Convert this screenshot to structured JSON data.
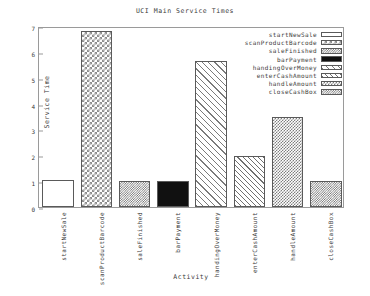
{
  "chart_data": {
    "type": "bar",
    "title": "UCI Main Service Times",
    "xlabel": "Activity",
    "ylabel": "Service Time",
    "ylim": [
      0,
      7
    ],
    "yticks": [
      "0",
      "1",
      "2",
      "3",
      "4",
      "5",
      "6",
      "7"
    ],
    "grid": false,
    "legend_position": "top-right",
    "categories": [
      "startNewSale",
      "scanProductBarcode",
      "saleFinished",
      "barPayment",
      "handingOverMoney",
      "enterCashAmount",
      "handleAmount",
      "closeCashBox"
    ],
    "values": [
      1.03,
      6.8,
      1.02,
      1.02,
      5.65,
      1.99,
      3.47,
      0.99
    ],
    "series": [
      {
        "name": "Service Time",
        "values": [
          1.03,
          6.8,
          1.02,
          1.02,
          5.65,
          1.99,
          3.47,
          0.99
        ]
      }
    ],
    "legend": [
      {
        "label": "startNewSale",
        "pattern": "empty"
      },
      {
        "label": "scanProductBarcode",
        "pattern": "check-coarse"
      },
      {
        "label": "saleFinished",
        "pattern": "check-dense"
      },
      {
        "label": "barPayment",
        "pattern": "solid"
      },
      {
        "label": "handingOverMoney",
        "pattern": "hatch-diag-wide"
      },
      {
        "label": "enterCashAmount",
        "pattern": "hatch-diag"
      },
      {
        "label": "handleAmount",
        "pattern": "check-fine"
      },
      {
        "label": "closeCashBox",
        "pattern": "check-dense"
      }
    ],
    "colors": {
      "background": "#ffffff",
      "axis": "#9a9a9a",
      "text": "#3a3a3a",
      "bar_outline": "#5a5a5a",
      "fill_dark": "#111111"
    }
  }
}
